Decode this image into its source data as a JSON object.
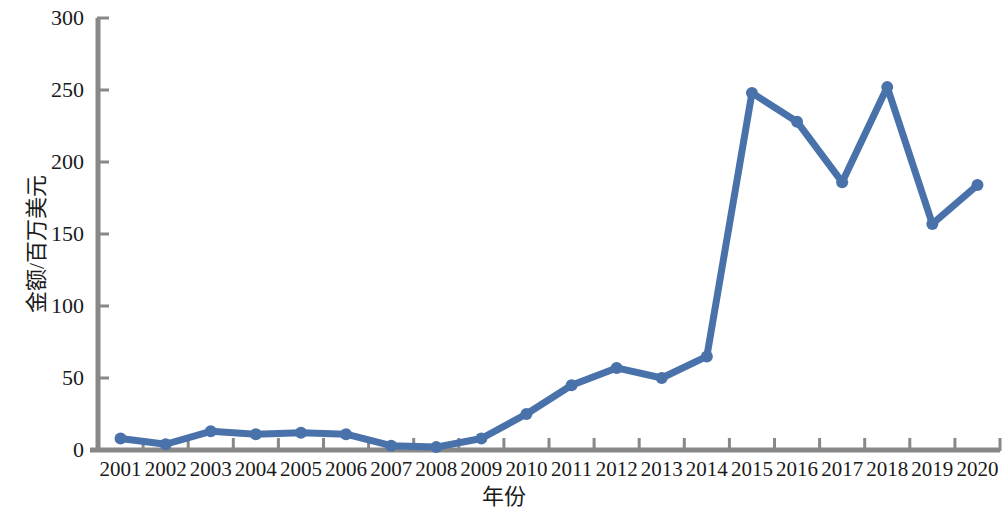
{
  "chart_data": {
    "type": "line",
    "title": "",
    "xlabel": "年份",
    "ylabel": "金额/百万美元",
    "categories": [
      "2001",
      "2002",
      "2003",
      "2004",
      "2005",
      "2006",
      "2007",
      "2008",
      "2009",
      "2010",
      "2011",
      "2012",
      "2013",
      "2014",
      "2015",
      "2016",
      "2017",
      "2018",
      "2019",
      "2020"
    ],
    "values": [
      8,
      4,
      13,
      11,
      12,
      11,
      3,
      2,
      8,
      25,
      45,
      57,
      50,
      65,
      248,
      228,
      186,
      252,
      157,
      184
    ],
    "series": [
      {
        "name": "金额/百万美元",
        "values": [
          8,
          4,
          13,
          11,
          12,
          11,
          3,
          2,
          8,
          25,
          45,
          57,
          50,
          65,
          248,
          228,
          186,
          252,
          157,
          184
        ]
      }
    ],
    "ylim": [
      0,
      300
    ],
    "y_ticks": [
      "0",
      "50",
      "100",
      "150",
      "200",
      "250",
      "300"
    ],
    "y_tick_values": [
      0,
      50,
      100,
      150,
      200,
      250,
      300
    ],
    "x_ticks": [
      "2001",
      "2002",
      "2003",
      "2004",
      "2005",
      "2006",
      "2007",
      "2008",
      "2009",
      "2010",
      "2011",
      "2012",
      "2013",
      "2014",
      "2015",
      "2016",
      "2017",
      "2018",
      "2019",
      "2020"
    ],
    "grid": false,
    "legend": "none",
    "line_color": "#4a72aa",
    "marker_color": "#4a72aa",
    "axis_color": "#808080",
    "text_color": "#1a1a1a",
    "marker": "circle"
  }
}
